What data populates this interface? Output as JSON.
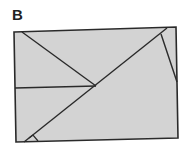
{
  "figure": {
    "panel_label": "B",
    "fill_color": "#d3d3d3",
    "stroke_color": "#2a2a2a",
    "rectangle": {
      "points": [
        [
          14,
          32
        ],
        [
          176,
          27
        ],
        [
          178,
          138
        ],
        [
          16,
          142
        ]
      ]
    },
    "lines": [
      {
        "name": "diagonal",
        "from": [
          24,
          142
        ],
        "to": [
          167,
          28
        ]
      },
      {
        "name": "upper-left-segment",
        "from": [
          22,
          32
        ],
        "to": [
          96,
          86
        ]
      },
      {
        "name": "horizontal-segment",
        "from": [
          15,
          88
        ],
        "to": [
          96,
          86
        ]
      },
      {
        "name": "right-segment",
        "from": [
          161,
          34
        ],
        "to": [
          177,
          82
        ]
      }
    ],
    "angle_marker": {
      "points": [
        [
          29,
          138
        ],
        [
          33,
          135
        ],
        [
          38,
          141
        ]
      ]
    }
  }
}
